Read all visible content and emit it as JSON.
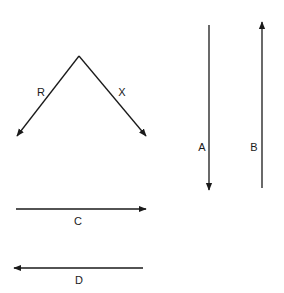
{
  "diagram": {
    "stroke_color": "#1a1a1a",
    "vectors": [
      {
        "id": "R",
        "label": "R",
        "x1": 79,
        "y1": 56,
        "x2": 17,
        "y2": 136,
        "label_x": 41,
        "label_y": 92
      },
      {
        "id": "X",
        "label": "X",
        "x1": 79,
        "y1": 56,
        "x2": 146,
        "y2": 136,
        "label_x": 122,
        "label_y": 92
      },
      {
        "id": "A",
        "label": "A",
        "x1": 209,
        "y1": 25,
        "x2": 209,
        "y2": 190,
        "label_x": 202,
        "label_y": 147
      },
      {
        "id": "B",
        "label": "B",
        "x1": 262,
        "y1": 188,
        "x2": 262,
        "y2": 22,
        "label_x": 254,
        "label_y": 147
      },
      {
        "id": "C",
        "label": "C",
        "x1": 16,
        "y1": 209,
        "x2": 146,
        "y2": 209,
        "label_x": 78,
        "label_y": 221
      },
      {
        "id": "D",
        "label": "D",
        "x1": 143,
        "y1": 268,
        "x2": 14,
        "y2": 268,
        "label_x": 79,
        "label_y": 280
      }
    ]
  }
}
